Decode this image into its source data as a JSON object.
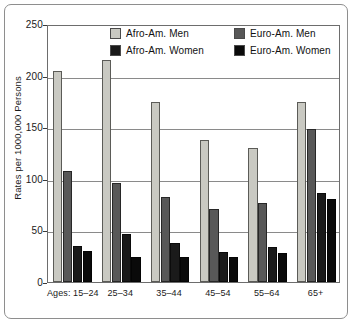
{
  "chart_data": {
    "type": "bar",
    "title": "",
    "subtitle": "",
    "xlabel": "",
    "ylabel": "Rates per 1000,000 Persons",
    "categories": [
      "Ages: 15–24",
      "25–34",
      "35–44",
      "45–54",
      "55–64",
      "65+"
    ],
    "series": [
      {
        "name": "Afro-Am. Men",
        "color": "#c9c9c2",
        "values": [
          204,
          215,
          174,
          138,
          130,
          174
        ]
      },
      {
        "name": "Afro-Am. Women",
        "color": "#1a1a1a",
        "values": [
          35,
          47,
          38,
          29,
          34,
          86
        ]
      },
      {
        "name": "Euro-Am. Men",
        "color": "#585858",
        "values": [
          108,
          96,
          82,
          71,
          77,
          148
        ]
      },
      {
        "name": "Euro-Am. Women",
        "color": "#0a0a0a",
        "values": [
          30,
          24,
          24,
          24,
          28,
          80
        ]
      }
    ],
    "bar_order": [
      "Afro-Am. Men",
      "Euro-Am. Men",
      "Afro-Am. Women",
      "Euro-Am. Women"
    ],
    "ylim": [
      0,
      250
    ],
    "yticks": [
      0,
      50,
      100,
      150,
      200,
      250
    ],
    "ytick_labels": [
      "0",
      "50",
      "100",
      "150",
      "200",
      "250"
    ],
    "grid": true,
    "grid_axis": "y",
    "legend_position": "top-center",
    "legend": [
      {
        "label": "Afro-Am. Men",
        "color": "#c9c9c2"
      },
      {
        "label": "Euro-Am. Men",
        "color": "#585858"
      },
      {
        "label": "Afro-Am. Women",
        "color": "#1a1a1a"
      },
      {
        "label": "Euro-Am. Women",
        "color": "#0a0a0a"
      }
    ]
  },
  "colors": {
    "frame": "#8e8e8e",
    "axis": "#6d6d6d",
    "gridline": "#8a8a8a",
    "text": "#1a1a1a",
    "background": "#ffffff"
  }
}
